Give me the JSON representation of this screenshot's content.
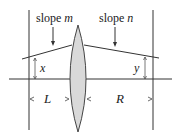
{
  "diagram": {
    "labels": {
      "slope_left_word": "slope",
      "slope_left_var": "m",
      "slope_right_word": "slope",
      "slope_right_var": "n",
      "angle_left": "x",
      "angle_right": "y",
      "distance_left": "L",
      "distance_right": "R"
    },
    "colors": {
      "line": "#333333",
      "lens_fill": "#d9d9d9",
      "lens_stroke": "#444444",
      "text": "#222222"
    }
  }
}
